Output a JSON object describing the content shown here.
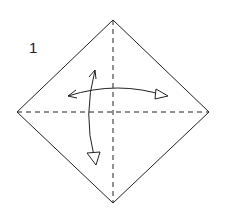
{
  "diagram": {
    "step_number": "1",
    "colors": {
      "line": "#222222",
      "background": "#ffffff"
    },
    "square": {
      "orientation": "diamond",
      "vertices": {
        "top": [
          113,
          20
        ],
        "right": [
          209,
          112
        ],
        "bottom": [
          113,
          203
        ],
        "left": [
          17,
          112
        ]
      }
    },
    "creases": [
      {
        "type": "valley-fold",
        "style": "dashed",
        "direction": "horizontal"
      },
      {
        "type": "valley-fold",
        "style": "dashed",
        "direction": "vertical"
      }
    ],
    "arrows": [
      {
        "name": "fold-unfold-horizontal",
        "style": "double-headed",
        "description": "fold left corner to right and unfold"
      },
      {
        "name": "fold-unfold-vertical",
        "style": "double-headed",
        "description": "fold top corner to bottom and unfold"
      }
    ]
  }
}
